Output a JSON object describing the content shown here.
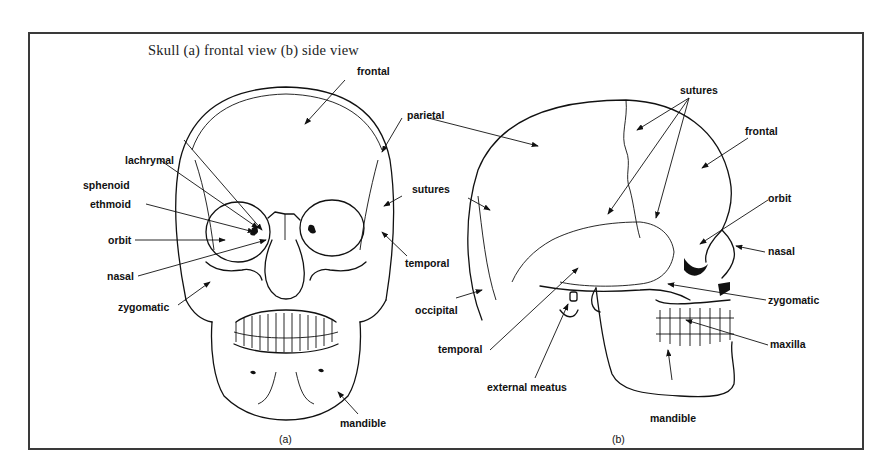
{
  "figure": {
    "title": "Skull (a) frontal view (b) side view",
    "panel_a": {
      "caption": "(a)",
      "labels": {
        "frontal": "frontal",
        "parietal": "parietal",
        "lachrymal": "lachrymal",
        "sphenoid": "sphenoid",
        "ethmoid": "ethmoid",
        "orbit": "orbit",
        "nasal": "nasal",
        "zygomatic": "zygomatic",
        "sutures": "sutures",
        "temporal": "temporal",
        "mandible": "mandible"
      }
    },
    "panel_b": {
      "caption": "(b)",
      "labels": {
        "sutures": "sutures",
        "frontal": "frontal",
        "orbit": "orbit",
        "nasal": "nasal",
        "zygomatic": "zygomatic",
        "maxilla": "maxilla",
        "mandible": "mandible",
        "occipital": "occipital",
        "temporal": "temporal",
        "external_meatus": "external meatus"
      }
    },
    "colors": {
      "line": "#111111",
      "border": "#3a3a3a",
      "background": "#ffffff"
    }
  }
}
